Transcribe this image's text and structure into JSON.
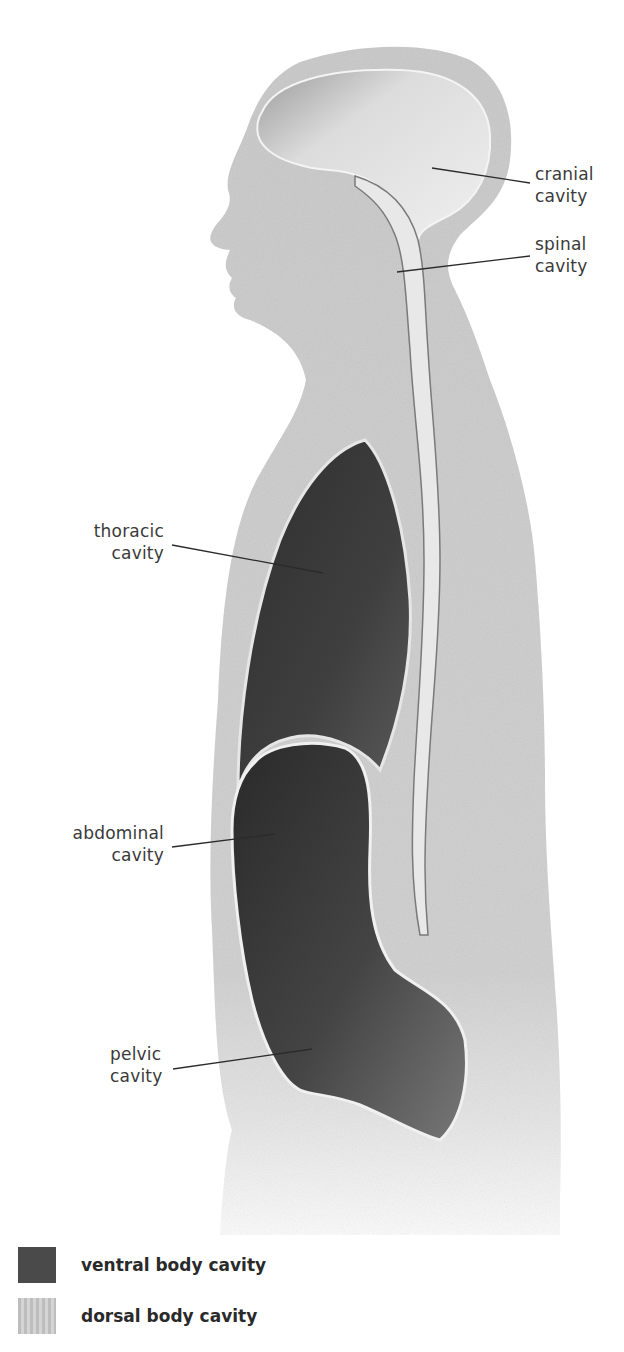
{
  "figure": {
    "colors": {
      "body_tissue": "#c9c9c9",
      "body_tissue_fade": "#e6e6e6",
      "ventral_cavity": "#3e3e3e",
      "ventral_cavity_light": "#6a6a6a",
      "dorsal_cavity": "#e8e8e8",
      "leader_line": "#2b2b2b",
      "label_text": "#3a3a3a"
    }
  },
  "labels": {
    "cranial": {
      "line1": "cranial",
      "line2": "cavity"
    },
    "spinal": {
      "line1": "spinal",
      "line2": "cavity"
    },
    "thoracic": {
      "line1": "thoracic",
      "line2": "cavity"
    },
    "abdominal": {
      "line1": "abdominal",
      "line2": "cavity"
    },
    "pelvic": {
      "line1": "pelvic",
      "line2": "cavity"
    }
  },
  "legend": {
    "items": [
      {
        "label": "ventral body cavity",
        "color": "#4a4a4a"
      },
      {
        "label": "dorsal body cavity",
        "color": "#c4c4c4"
      }
    ]
  }
}
